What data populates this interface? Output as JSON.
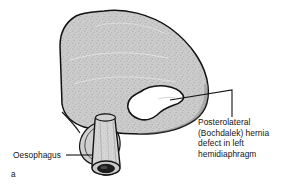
{
  "figure": {
    "caption_letter": "a",
    "background_color": "#ffffff",
    "outline_color": "#101010",
    "fill_color": "#c9c9c9",
    "defect_fill_color": "#ffffff"
  },
  "labels": {
    "hernia": {
      "name": "posterolateral-bochdalek-hernia-label",
      "lines": [
        "Posterolateral",
        "(Bochdalek) hernia",
        "defect in left",
        "hemidiaphragm"
      ],
      "full_text": "Posterolateral (Bochdalek) hernia defect in left hemidiaphragm"
    },
    "oesophagus": {
      "name": "oesophagus-label",
      "text": "Oesophagus"
    }
  },
  "structures": {
    "diaphragm": "left hemidiaphragm dome, stippled grey",
    "defect": "irregular white hernia defect opening",
    "oesophagus_tube": "cylindrical oesophagus passing through hiatus",
    "oesophageal_lumen": "dark elliptical lumen at cut end"
  },
  "leaders": {
    "hernia_leader": "from defect right edge, horizontal then vertical down to text block",
    "oesophagus_leader": "horizontal line from label to oesophagus tube"
  }
}
